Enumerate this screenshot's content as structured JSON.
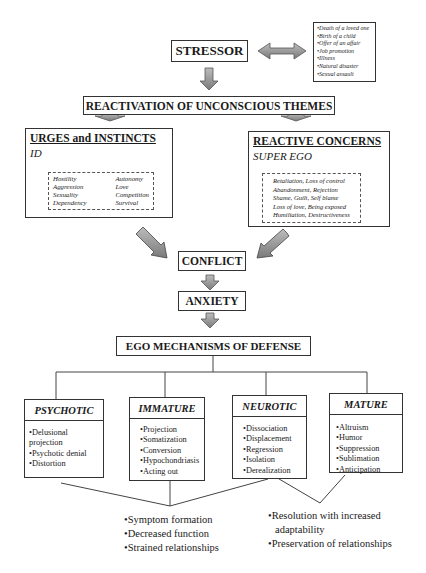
{
  "stressor": {
    "label": "STRESSOR",
    "examples": [
      "•Death of a loved one",
      "•Birth of a child",
      "•Offer of an affair",
      "•Job promotion",
      "•Illness",
      "•Natural disaster",
      "•Sexual assault"
    ]
  },
  "reactivation": {
    "label": "REACTIVATION OF UNCONSCIOUS THEMES"
  },
  "urges": {
    "title": "URGES and INSTINCTS",
    "subtitle": "ID",
    "col1": [
      "Hostility",
      "Aggression",
      "Sexuality",
      "Dependency"
    ],
    "col2": [
      "Autonomy",
      "Love",
      "Competition",
      "Survival"
    ]
  },
  "reactive": {
    "title": "REACTIVE CONCERNS",
    "subtitle": "SUPER EGO",
    "items": [
      "Retaliation, Loss of control",
      "Abandonment, Rejection",
      "Shame, Guilt, Self blame",
      "Loss of love, Being exposed",
      "Humiliation, Destructiveness"
    ]
  },
  "conflict": {
    "label": "CONFLICT"
  },
  "anxiety": {
    "label": "ANXIETY"
  },
  "ego": {
    "label": "EGO MECHANISMS OF DEFENSE"
  },
  "defenses": [
    {
      "title": "PSYCHOTIC",
      "items": [
        "•Delusional projection",
        "•Psychotic denial",
        "•Distortion"
      ]
    },
    {
      "title": "IMMATURE",
      "items": [
        "•Projection",
        "•Somatization",
        "•Conversion",
        "•Hypochondriasis",
        "•Acting out"
      ]
    },
    {
      "title": "NEUROTIC",
      "items": [
        "•Dissociation",
        "•Displacement",
        "•Regression",
        "•Isolation",
        "•Derealization"
      ]
    },
    {
      "title": "MATURE",
      "items": [
        "•Altruism",
        "•Humor",
        "•Suppression",
        "•Sublimation",
        "•Anticipation"
      ]
    }
  ],
  "outcomes": {
    "negative": [
      "•Symptom formation",
      "•Decreased function",
      "•Strained relationships"
    ],
    "positive": [
      "•Resolution with increased",
      "adaptability",
      "•Preservation of relationships"
    ]
  },
  "colors": {
    "arrow_fill": "#9a9a9a",
    "arrow_stroke": "#555555",
    "line": "#333333"
  }
}
